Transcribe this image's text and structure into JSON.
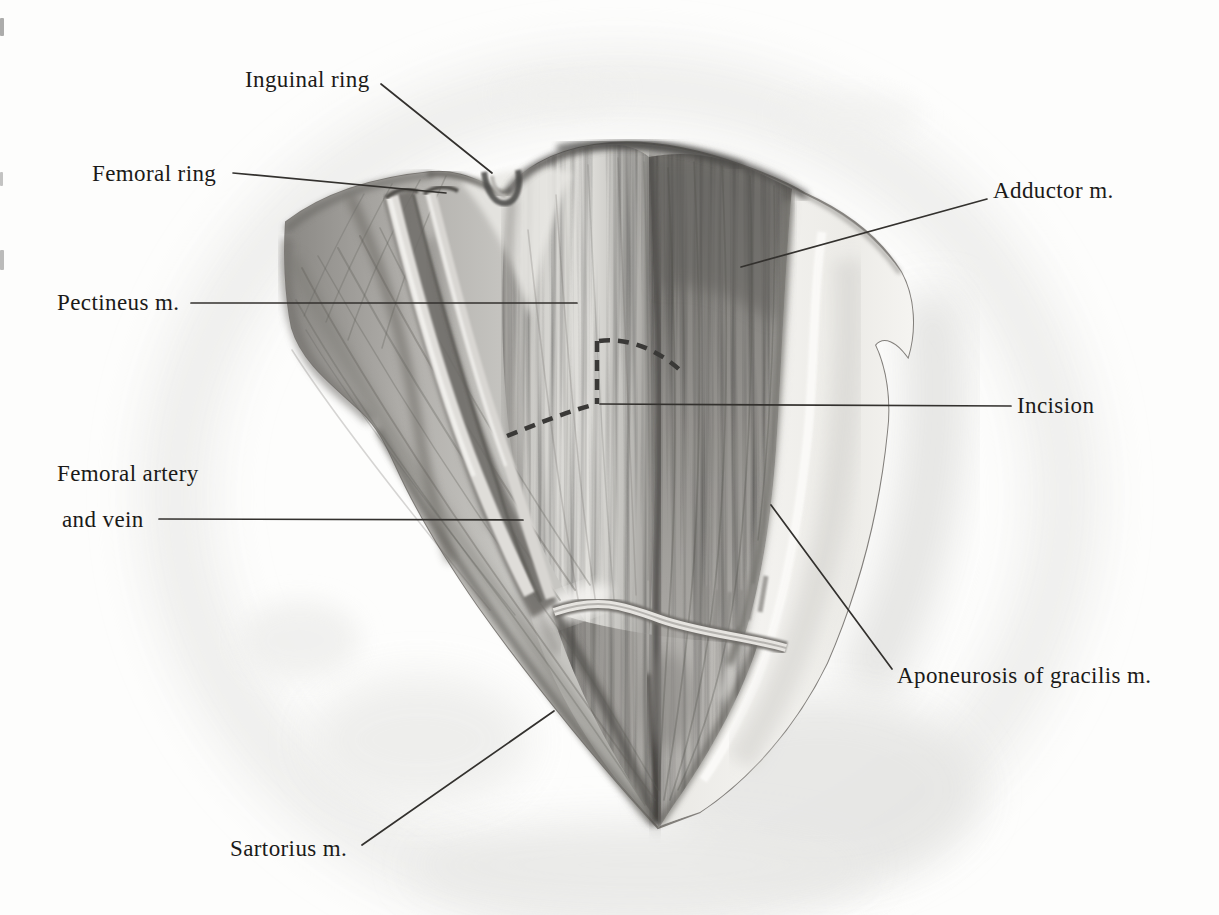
{
  "figure": {
    "labels": {
      "inguinal_ring": "Inguinal ring",
      "femoral_ring": "Femoral ring",
      "pectineus": "Pectineus m.",
      "femoral_vessels_line1": "Femoral artery",
      "femoral_vessels_line2": "and vein",
      "sartorius": "Sartorius m.",
      "adductor": "Adductor m.",
      "incision": "Incision",
      "aponeurosis_gracilis": "Aponeurosis of gracilis m."
    },
    "colors": {
      "ink": "#1b1a18",
      "leader_line": "#33312e",
      "paper": "#fdfdfc",
      "background_wash": "#e7e7e5",
      "muscle_light": "#d8d7d3",
      "muscle_mid": "#a8a6a2",
      "muscle_dark": "#6f6d69",
      "aponeurosis_pale": "#f1f0ed",
      "incision_dash": "#3a3937"
    }
  }
}
